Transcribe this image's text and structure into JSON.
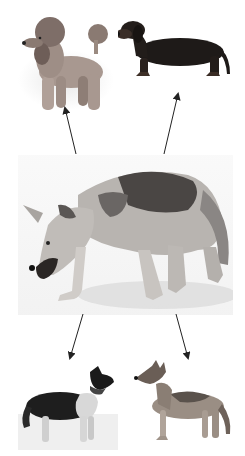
{
  "diagram": {
    "type": "evolution-tree",
    "source": {
      "name": "wolf",
      "description": "grey wolf walking, head lowered"
    },
    "targets": [
      {
        "name": "poodle",
        "position": "top-left",
        "description": "apricot standard poodle standing, facing left"
      },
      {
        "name": "dachshund",
        "position": "top-right",
        "description": "black-and-tan smooth dachshund standing, facing left"
      },
      {
        "name": "border-collie",
        "position": "bottom-left",
        "description": "black and white collie-type dog looking up right"
      },
      {
        "name": "german-shepherd",
        "position": "bottom-right",
        "description": "sable shepherd-type dog facing left"
      }
    ],
    "arrows": [
      {
        "from": "wolf",
        "to": "poodle"
      },
      {
        "from": "wolf",
        "to": "dachshund"
      },
      {
        "from": "wolf",
        "to": "border-collie"
      },
      {
        "from": "wolf",
        "to": "german-shepherd"
      }
    ]
  },
  "colors": {
    "background": "#ffffff",
    "arrow": "#222222"
  }
}
